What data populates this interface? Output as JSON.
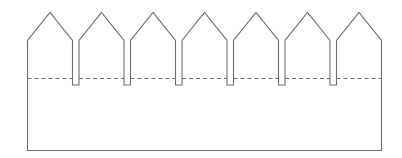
{
  "diagram": {
    "points_count": 7,
    "notches_count": 6,
    "has_fold_line": true,
    "fold_line_style": "dashed",
    "colors": {
      "outline": "#6e6e6e",
      "background": "#ffffff"
    }
  }
}
